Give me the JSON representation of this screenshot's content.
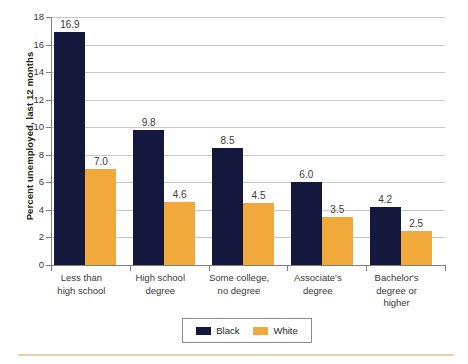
{
  "chart_data": {
    "type": "bar",
    "title": "",
    "subtitle": "",
    "xlabel": "",
    "ylabel": "Percent unemployed, last 12 months",
    "ylim": [
      0,
      18
    ],
    "ytick_step": 2,
    "yticks": [
      "18",
      "16",
      "14",
      "12",
      "10",
      "8",
      "6",
      "4",
      "2",
      "0"
    ],
    "grid": true,
    "legend_position": "bottom-center",
    "categories": [
      "Less than\nhigh school",
      "High school\ndegree",
      "Some college,\nno degree",
      "Associate's\ndegree",
      "Bachelor's\ndegree or\nhigher"
    ],
    "series": [
      {
        "name": "Black",
        "color": "#14183C",
        "values": [
          16.9,
          9.8,
          8.5,
          6.0,
          4.2
        ],
        "labels": [
          "16.9",
          "9.8",
          "8.5",
          "6.0",
          "4.2"
        ]
      },
      {
        "name": "White",
        "color": "#F2A93B",
        "values": [
          7.0,
          4.6,
          4.5,
          3.5,
          2.5
        ],
        "labels": [
          "7.0",
          "4.6",
          "4.5",
          "3.5",
          "2.5"
        ]
      }
    ]
  },
  "legend": {
    "items": [
      {
        "label": "Black",
        "color": "#14183C"
      },
      {
        "label": "White",
        "color": "#F2A93B"
      }
    ]
  },
  "colors": {
    "series_black": "#14183C",
    "series_white": "#F2A93B",
    "gridline": "#C9C9C9",
    "axis": "#808080",
    "text": "#3A3A3A",
    "bottom_rule": "#EFD0A4"
  }
}
